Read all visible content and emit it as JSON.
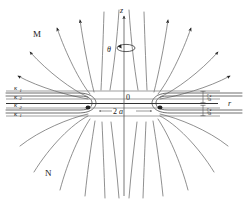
{
  "figure": {
    "background_color": "#ffffff",
    "line_color": "#6b6b6b",
    "text_color": "#1a1a1a"
  },
  "axes": {
    "vertical": {
      "name": "z-axis",
      "label": "z",
      "x": 124,
      "y_top": 14,
      "y_bottom": 196,
      "arrow": "up"
    },
    "horizontal": {
      "name": "r-axis",
      "label": "r",
      "y": 103,
      "x_left": 6,
      "x_right": 228,
      "arrow": "none"
    },
    "azimuth": {
      "name": "theta-rotation",
      "label": "θ",
      "cx": 124,
      "cy": 48,
      "rx": 9,
      "ry": 3.6
    }
  },
  "origin": {
    "label": "0",
    "x": 124,
    "y": 103
  },
  "poles": {
    "upper": {
      "label": "M",
      "x": 38,
      "y": 33
    },
    "lower": {
      "label": "N",
      "x": 50,
      "y": 172
    }
  },
  "layers": [
    {
      "label": "κ",
      "subscript": "1",
      "y": 91,
      "text_x": 14,
      "text_y": 92
    },
    {
      "label": "κ",
      "subscript": "2",
      "y": 99,
      "text_x": 14,
      "text_y": 101
    },
    {
      "label": "κ",
      "subscript": "2",
      "y": 108,
      "text_x": 14,
      "text_y": 110
    },
    {
      "label": "κ",
      "subscript": "1",
      "y": 116,
      "text_x": 14,
      "text_y": 118
    }
  ],
  "dimensions": {
    "gap": {
      "label": "2a",
      "numeral": "2",
      "symbol": "a",
      "x": 118,
      "y": 113,
      "arrow_left_x": 100,
      "arrow_right_x": 150
    },
    "thickness_upper": {
      "label": "d/2",
      "numerator": "d",
      "denominator": "2",
      "x": 208,
      "y_top": 91,
      "y_bottom": 103
    },
    "thickness_lower": {
      "label": "d/2",
      "numerator": "d",
      "denominator": "2",
      "x": 208,
      "y_top": 108,
      "y_bottom": 116
    }
  },
  "focus_points": [
    {
      "name": "left-focus",
      "x": 88,
      "y": 107
    },
    {
      "name": "right-focus",
      "x": 160,
      "y": 107
    }
  ],
  "field_lines": {
    "count": 20,
    "arrowhead_color": "#222222",
    "description": "Dipole-like field lines emanating from the two focal edges of the disk"
  }
}
